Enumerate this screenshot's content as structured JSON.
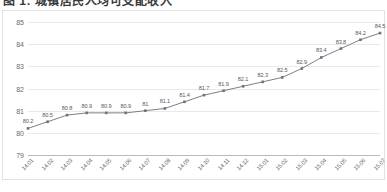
{
  "title": "图 1: 城镇居民人均可支配收入",
  "chart_data": {
    "type": "line",
    "title": "图 1: 城镇居民人均可支配收入",
    "xlabel": "",
    "ylabel": "",
    "ylim": [
      79,
      85
    ],
    "yticks": [
      "79",
      "80",
      "81",
      "82",
      "83",
      "84",
      "85"
    ],
    "grid": true,
    "legend": "none",
    "marker": "square",
    "series_color": "#7b7f88",
    "categories": [
      "14.01",
      "14.02",
      "14.03",
      "14.04",
      "14.05",
      "14.06",
      "14.07",
      "14.08",
      "14.09",
      "14.10",
      "14.11",
      "14.12",
      "15.01",
      "15.02",
      "15.03",
      "15.04",
      "15.05",
      "15.06",
      "15.07"
    ],
    "values": [
      80.2,
      80.5,
      80.8,
      80.9,
      80.9,
      80.9,
      81,
      81.1,
      81.4,
      81.7,
      81.9,
      82.1,
      82.3,
      82.5,
      82.9,
      83.4,
      83.8,
      84.2,
      84.5
    ],
    "data_labels": [
      "80.2",
      "80.5",
      "80.8",
      "80.9",
      "80.9",
      "80.9",
      "81",
      "81.1",
      "81.4",
      "81.7",
      "81.9",
      "82.1",
      "82.3",
      "82.5",
      "82.9",
      "83.4",
      "83.8",
      "84.2",
      "84.5"
    ]
  }
}
